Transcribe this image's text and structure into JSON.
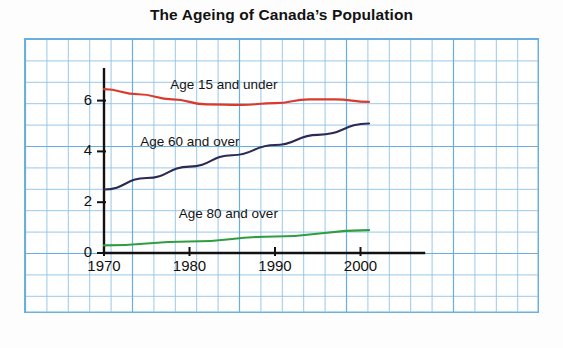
{
  "chart_data": {
    "type": "line",
    "title": "The Ageing of Canada’s Population",
    "xlabel": "Year",
    "ylabel": "Number of people (millions)",
    "ylabel_line1": "Number of people",
    "ylabel_line2": "(millions)",
    "xlim": [
      1970,
      2001
    ],
    "ylim": [
      0,
      7
    ],
    "grid": true,
    "grid_color": "#8fc2e8",
    "background": "#ffffff",
    "legend": "inline-labels",
    "xticks": [
      1970,
      1980,
      1990,
      2000
    ],
    "xtick_labels": [
      "1970",
      "1980",
      "1990",
      "2000"
    ],
    "yticks": [
      0,
      2,
      4,
      6
    ],
    "ytick_labels": [
      "0",
      "2",
      "4",
      "6"
    ],
    "series": [
      {
        "name": "Age 15 and under",
        "color": "#d93a2b",
        "label_x": 1985,
        "label_y": 6.55,
        "x": [
          1970,
          1974,
          1978,
          1982,
          1986,
          1990,
          1994,
          1997,
          2001
        ],
        "values": [
          6.45,
          6.25,
          6.05,
          5.85,
          5.83,
          5.9,
          6.05,
          6.05,
          5.95
        ]
      },
      {
        "name": "Age 60 and over",
        "color": "#2b2a55",
        "label_x": 1981.5,
        "label_y": 4.3,
        "x": [
          1970,
          1975,
          1980,
          1985,
          1990,
          1995,
          2001
        ],
        "values": [
          2.5,
          2.95,
          3.4,
          3.85,
          4.25,
          4.65,
          5.1
        ]
      },
      {
        "name": "Age 80 and over",
        "color": "#2f9e41",
        "label_x": 1986,
        "label_y": 1.45,
        "x": [
          1970,
          1980,
          1990,
          2001
        ],
        "values": [
          0.3,
          0.45,
          0.65,
          0.9
        ]
      }
    ]
  },
  "axes": {
    "axis_color": "#111111",
    "tick_count_x": 4,
    "tick_count_y": 4
  },
  "frame": {
    "border_color": "#6cb0e0"
  }
}
